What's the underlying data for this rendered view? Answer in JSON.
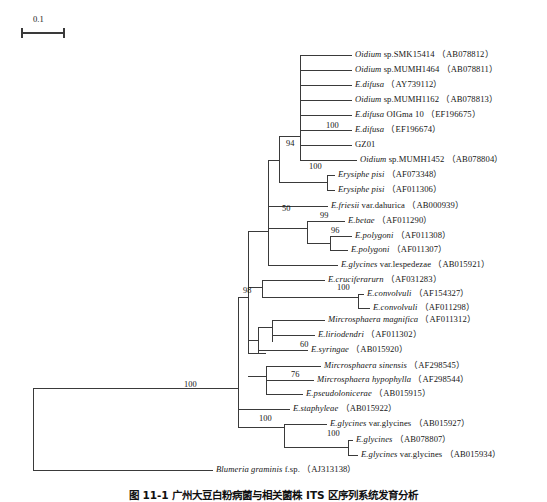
{
  "figure": {
    "type": "phylogenetic-tree",
    "scale_bar": {
      "label": "0.1",
      "x": 22,
      "y": 33,
      "length_px": 42
    },
    "caption": "图 11-1  广州大豆白粉病菌与相关菌株 ITS 区序列系统发育分析"
  },
  "taxa": [
    {
      "id": "t1",
      "italic": "Oidium",
      "roman": " sp.SMK15414",
      "accession": "（AB078812）",
      "y": 55,
      "tip_x": 352
    },
    {
      "id": "t2",
      "italic": "Oidium",
      "roman": " sp.MUMH1464",
      "accession": "（AB078811）",
      "y": 70,
      "tip_x": 352
    },
    {
      "id": "t3",
      "italic": "E.difusa",
      "roman": "",
      "accession": "（AY739112）",
      "y": 85,
      "tip_x": 352
    },
    {
      "id": "t4",
      "italic": "Oidium",
      "roman": " sp.MUMH1162",
      "accession": "（AB078813）",
      "y": 100,
      "tip_x": 352
    },
    {
      "id": "t5",
      "italic": "E.difusa",
      "roman": " OIGma 10",
      "accession": "（EF196675）",
      "y": 115,
      "tip_x": 352
    },
    {
      "id": "t6",
      "italic": "E.difusa",
      "roman": "",
      "accession": "（EF196674）",
      "y": 130,
      "tip_x": 352
    },
    {
      "id": "t7",
      "italic": "",
      "roman": "GZ01",
      "accession": "",
      "y": 145,
      "tip_x": 352
    },
    {
      "id": "t8",
      "italic": "Oidium",
      "roman": " sp.MUMH1452",
      "accession": "（AB078804）",
      "y": 160,
      "tip_x": 357
    },
    {
      "id": "t9",
      "italic": "Erysiphe pisi",
      "roman": "",
      "accession": "（AF073348）",
      "y": 175,
      "tip_x": 335
    },
    {
      "id": "t10",
      "italic": "Erysiphe pisi",
      "roman": "",
      "accession": "（AF011306）",
      "y": 190,
      "tip_x": 335
    },
    {
      "id": "t11",
      "italic": "E.friesii",
      "roman": " var.dahurica",
      "accession": "（AB000939）",
      "y": 206,
      "tip_x": 328
    },
    {
      "id": "t12",
      "italic": "E.betae",
      "roman": "",
      "accession": "（AF011290）",
      "y": 221,
      "tip_x": 345
    },
    {
      "id": "t13",
      "italic": "E.polygoni",
      "roman": "",
      "accession": "（AF011308）",
      "y": 236,
      "tip_x": 352
    },
    {
      "id": "t14",
      "italic": "E.polygoni",
      "roman": "",
      "accession": "（AF011307）",
      "y": 250,
      "tip_x": 348
    },
    {
      "id": "t15",
      "italic": "E.glycines",
      "roman": " var.lespedezae",
      "accession": "（AB015921）",
      "y": 265,
      "tip_x": 338
    },
    {
      "id": "t16",
      "italic": "E.cruciferarurn",
      "roman": "",
      "accession": "（AF031283）",
      "y": 280,
      "tip_x": 325
    },
    {
      "id": "t17",
      "italic": "E.convolvuli",
      "roman": "",
      "accession": "（AF154327）",
      "y": 294,
      "tip_x": 364
    },
    {
      "id": "t18",
      "italic": "E.convolvuli",
      "roman": "",
      "accession": "（AF011298）",
      "y": 308,
      "tip_x": 370
    },
    {
      "id": "t19",
      "italic": "Mircrosphaera magnifica",
      "roman": "",
      "accession": "（AF011312）",
      "y": 320,
      "tip_x": 325
    },
    {
      "id": "t20",
      "italic": "E.liriodendri",
      "roman": "",
      "accession": "（AF011302）",
      "y": 335,
      "tip_x": 315
    },
    {
      "id": "t21",
      "italic": "E.syringae",
      "roman": "",
      "accession": "（AB015920）",
      "y": 350,
      "tip_x": 308
    },
    {
      "id": "t22",
      "italic": "Mircrosphaera sinensis",
      "roman": "",
      "accession": "（AF298545）",
      "y": 366,
      "tip_x": 321
    },
    {
      "id": "t23",
      "italic": "Mircrosphaera hypophylla",
      "roman": "",
      "accession": "（AF298544）",
      "y": 380,
      "tip_x": 314
    },
    {
      "id": "t24",
      "italic": "E.pseudolonicerae",
      "roman": "",
      "accession": "（AB015915）",
      "y": 394,
      "tip_x": 303
    },
    {
      "id": "t25",
      "italic": "E.staphyleae",
      "roman": "",
      "accession": "（AB015922）",
      "y": 409,
      "tip_x": 290
    },
    {
      "id": "t26",
      "italic": "E.glycines",
      "roman": " var.glycines",
      "accession": "（AB015927）",
      "y": 424,
      "tip_x": 327
    },
    {
      "id": "t27",
      "italic": "E.glycines",
      "roman": "",
      "accession": "（AB078807）",
      "y": 440,
      "tip_x": 353
    },
    {
      "id": "t28",
      "italic": "E.glycines",
      "roman": " var.glycines",
      "accession": "（AB015934）",
      "y": 455,
      "tip_x": 358
    },
    {
      "id": "t29",
      "italic": "Blumeria graminis",
      "roman": " f.sp.",
      "accession": "（AJ313138）",
      "y": 470,
      "tip_x": 213
    }
  ],
  "bootstrap": [
    {
      "id": "b1",
      "value": "100",
      "x": 326,
      "y": 126
    },
    {
      "id": "b2",
      "value": "94",
      "x": 286,
      "y": 144
    },
    {
      "id": "b3",
      "value": "100",
      "x": 309,
      "y": 167
    },
    {
      "id": "b4",
      "value": "50",
      "x": 282,
      "y": 209
    },
    {
      "id": "b5",
      "value": "99",
      "x": 320,
      "y": 216
    },
    {
      "id": "b6",
      "value": "96",
      "x": 331,
      "y": 231
    },
    {
      "id": "b7",
      "value": "98",
      "x": 243,
      "y": 291
    },
    {
      "id": "b8",
      "value": "100",
      "x": 337,
      "y": 288
    },
    {
      "id": "b9",
      "value": "60",
      "x": 300,
      "y": 345
    },
    {
      "id": "b10",
      "value": "76",
      "x": 291,
      "y": 375
    },
    {
      "id": "b11",
      "value": "100",
      "x": 184,
      "y": 385
    },
    {
      "id": "b12",
      "value": "100",
      "x": 259,
      "y": 419
    },
    {
      "id": "b13",
      "value": "100",
      "x": 327,
      "y": 434
    }
  ],
  "branches": {
    "description": "rectangular cladogram polyline coordinates",
    "segments": [
      {
        "name": "root-vertical",
        "d": "M 33 388 L 33 470"
      },
      {
        "name": "root-to-ingroup",
        "d": "M 33 388 L 238 388"
      },
      {
        "name": "root-to-outgroup",
        "d": "M 33 470 L 213 470"
      },
      {
        "name": "ingroup-vertical",
        "d": "M 238 388 L 238 427"
      },
      {
        "name": "node98-stem",
        "d": "M 238 297 L 238 388"
      },
      {
        "name": "node98-vertical",
        "d": "M 248 231 L 248 353"
      },
      {
        "name": "node98-connect",
        "d": "M 238 297 L 248 297"
      },
      {
        "name": "clade50-stem",
        "d": "M 248 231 L 268 231"
      },
      {
        "name": "clade50-vertical",
        "d": "M 268 160 L 268 265"
      },
      {
        "name": "clade94-stem",
        "d": "M 268 160 L 279 160"
      },
      {
        "name": "clade94-vertical",
        "d": "M 279 136 L 279 182"
      },
      {
        "name": "clade100a-stem",
        "d": "M 279 136 L 300 136"
      },
      {
        "name": "clade100a-vertical",
        "d": "M 300 55 L 300 160"
      },
      {
        "name": "tip1",
        "d": "M 300 55 L 352 55"
      },
      {
        "name": "tip2",
        "d": "M 300 70 L 352 70"
      },
      {
        "name": "tip3",
        "d": "M 300 85 L 352 85"
      },
      {
        "name": "tip4",
        "d": "M 300 100 L 352 100"
      },
      {
        "name": "tip5",
        "d": "M 300 115 L 352 115"
      },
      {
        "name": "tip6",
        "d": "M 300 130 L 352 130"
      },
      {
        "name": "tip7",
        "d": "M 300 145 L 352 145"
      },
      {
        "name": "tip8",
        "d": "M 300 160 L 357 160"
      },
      {
        "name": "clade100b-stem",
        "d": "M 279 182 L 327 182"
      },
      {
        "name": "clade100b-vertical",
        "d": "M 327 175 L 327 190"
      },
      {
        "name": "tip9",
        "d": "M 327 175 L 335 175"
      },
      {
        "name": "tip10",
        "d": "M 327 190 L 335 190"
      },
      {
        "name": "tip11",
        "d": "M 268 206 L 328 206"
      },
      {
        "name": "clade99-stem",
        "d": "M 268 228 L 307 228"
      },
      {
        "name": "clade99-vertical",
        "d": "M 307 221 L 307 243"
      },
      {
        "name": "tip12",
        "d": "M 307 221 L 345 221"
      },
      {
        "name": "clade96-stem",
        "d": "M 307 243 L 330 243"
      },
      {
        "name": "clade96-vertical",
        "d": "M 330 236 L 330 250"
      },
      {
        "name": "tip13",
        "d": "M 330 236 L 352 236"
      },
      {
        "name": "tip14",
        "d": "M 330 250 L 348 250"
      },
      {
        "name": "tip15",
        "d": "M 268 265 L 338 265"
      },
      {
        "name": "clade-cruc-vertical",
        "d": "M 262 280 L 262 297"
      },
      {
        "name": "clade-cruc-connect",
        "d": "M 248 287 L 262 287"
      },
      {
        "name": "tip16",
        "d": "M 262 280 L 325 280"
      },
      {
        "name": "clade100c-stem",
        "d": "M 262 297 L 358 297"
      },
      {
        "name": "clade100c-vertical",
        "d": "M 358 294 L 358 308"
      },
      {
        "name": "tip17",
        "d": "M 358 294 L 364 294"
      },
      {
        "name": "tip18",
        "d": "M 358 308 L 370 308"
      },
      {
        "name": "clade60-stem",
        "d": "M 248 340 L 258 340"
      },
      {
        "name": "clade60-vertical",
        "d": "M 258 327 L 258 353"
      },
      {
        "name": "clade-mirc-vertical",
        "d": "M 272 320 L 272 342"
      },
      {
        "name": "clade-mirc-connect",
        "d": "M 258 327 L 272 327"
      },
      {
        "name": "tip19",
        "d": "M 272 320 L 325 320"
      },
      {
        "name": "tip20",
        "d": "M 272 335 L 315 335"
      },
      {
        "name": "tip21",
        "d": "M 258 350 L 308 350"
      },
      {
        "name": "clade76-stem",
        "d": "M 248 353 L 266 353"
      },
      {
        "name": "clade76-vertical2",
        "d": "M 266 366 L 266 394"
      },
      {
        "name": "clade76-connect",
        "d": "M 248 376 L 266 376"
      },
      {
        "name": "tip22",
        "d": "M 266 366 L 321 366"
      },
      {
        "name": "clade76b-stem",
        "d": "M 266 380 L 278 380"
      },
      {
        "name": "tip23",
        "d": "M 278 380 L 314 380"
      },
      {
        "name": "tip24",
        "d": "M 266 394 L 303 394"
      },
      {
        "name": "tip25",
        "d": "M 238 409 L 290 409"
      },
      {
        "name": "clade100d-stem",
        "d": "M 238 427 L 284 427"
      },
      {
        "name": "clade100d-vertical",
        "d": "M 284 424 L 284 447"
      },
      {
        "name": "tip26",
        "d": "M 284 424 L 327 424"
      },
      {
        "name": "clade100e-stem",
        "d": "M 284 447 L 348 447"
      },
      {
        "name": "clade100e-vertical",
        "d": "M 348 440 L 348 455"
      },
      {
        "name": "tip27",
        "d": "M 348 440 L 353 440"
      },
      {
        "name": "tip28",
        "d": "M 348 455 L 358 455"
      },
      {
        "name": "tip29-outgroup",
        "d": "M 213 470 L 213 470"
      }
    ]
  }
}
